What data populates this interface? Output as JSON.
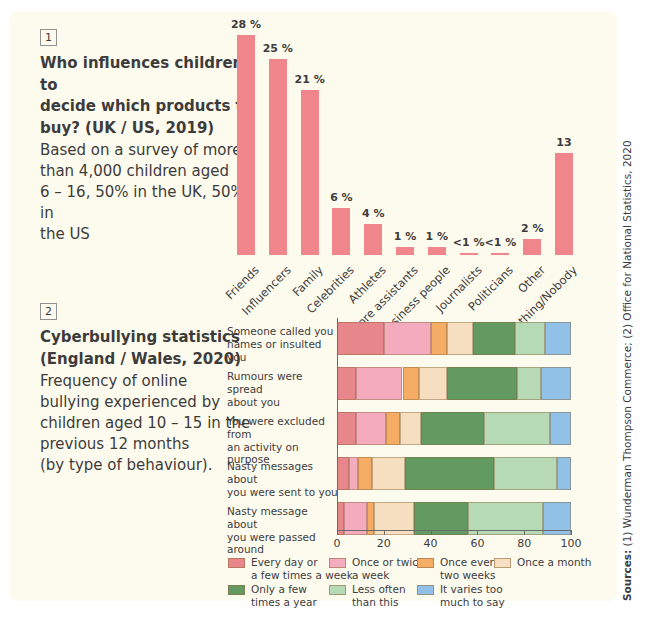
{
  "colors": {
    "page_bg": "#ffffff",
    "panel_bg": "#fdfbee",
    "text": "#3d3c3c",
    "axis": "#6a6a6a",
    "bar1": "#f0868c"
  },
  "source_note": {
    "label_bold": "Sources:",
    "text": "(1) Wunderman Thompson Commerce; (2) Office for National Statistics, 2020"
  },
  "chart_data": [
    {
      "type": "bar",
      "panel_index": "1",
      "title": "Who influences children to decide which products to buy? (UK / US, 2019)",
      "title_lines": [
        "Who influences children to",
        "decide which products to",
        "buy? (UK / US, 2019)"
      ],
      "subtitle": "Based on a survey of more than 4,000 children aged 6 – 16, 50% in the UK, 50% in the US",
      "subtitle_lines": [
        "Based on a survey of more",
        "than 4,000 children aged",
        "6 – 16, 50% in the UK, 50% in",
        "the US"
      ],
      "categories": [
        "Friends",
        "Influencers",
        "Family",
        "Celebrities",
        "Athletes",
        "Store assistants",
        "Business people",
        "Journalists",
        "Politicians",
        "Other",
        "Nothing/Nobody"
      ],
      "values": [
        28,
        25,
        21,
        6,
        4,
        1,
        1,
        0.5,
        0.5,
        2,
        13
      ],
      "value_labels": [
        "28 %",
        "25 %",
        "21 %",
        "6 %",
        "4 %",
        "1 %",
        "1 %",
        "<1 %",
        "<1 %",
        "2 %",
        "13"
      ],
      "bar_color": "#f0868c",
      "ylim": [
        0,
        30
      ],
      "grid": false,
      "legend_position": "none"
    },
    {
      "type": "bar",
      "subtype": "stacked_horizontal",
      "panel_index": "2",
      "title": "Cyberbullying statistics (England / Wales, 2020)",
      "title_lines": [
        "Cyberbullying statistics",
        "(England / Wales, 2020)"
      ],
      "subtitle": "Frequency of online bullying experienced by children aged 10 – 15 in the previous 12 months (by type of behaviour).",
      "subtitle_lines": [
        "Frequency of online",
        "bullying experienced by",
        "children aged 10 – 15 in the",
        "previous 12 months",
        "(by type of behaviour)."
      ],
      "categories": [
        "Someone called you names or insulted you",
        "Rumours were spread about you",
        "You were excluded from an activity on purpose",
        "Nasty messages about you were sent to you",
        "Nasty message about you were passed around"
      ],
      "category_lines": [
        [
          "Someone called you",
          "names or insulted you"
        ],
        [
          "Rumours were spread",
          "about you"
        ],
        [
          "You were excluded from",
          "an activity on purpose"
        ],
        [
          "Nasty messages about",
          "you were sent to you"
        ],
        [
          "Nasty message about",
          "you were passed around"
        ]
      ],
      "series": [
        {
          "name": "Every day or a few times a week",
          "legend_lines": [
            "Every day or",
            "a few times a week"
          ],
          "color": "#e8878b",
          "values": [
            20,
            8,
            8,
            5,
            3
          ]
        },
        {
          "name": "Once or twice a week",
          "legend_lines": [
            "Once or twice",
            "a week"
          ],
          "color": "#f3abbd",
          "values": [
            20,
            20,
            13,
            4,
            10
          ]
        },
        {
          "name": "Once every two weeks",
          "legend_lines": [
            "Once every",
            "two weeks"
          ],
          "color": "#f5ad66",
          "values": [
            7,
            7,
            6,
            6,
            3
          ]
        },
        {
          "name": "Once a month",
          "legend_lines": [
            "Once a month"
          ],
          "color": "#f6dfc0",
          "values": [
            11,
            12,
            9,
            14,
            17
          ]
        },
        {
          "name": "Only a few times a year",
          "legend_lines": [
            "Only a few",
            "times a year"
          ],
          "color": "#629a62",
          "values": [
            18,
            30,
            27,
            38,
            23
          ]
        },
        {
          "name": "Less often than this",
          "legend_lines": [
            "Less often",
            "than this"
          ],
          "color": "#b6d9b6",
          "values": [
            13,
            10,
            28,
            27,
            32
          ]
        },
        {
          "name": "It varies too much to say",
          "legend_lines": [
            "It varies too",
            "much to say"
          ],
          "color": "#92c1e8",
          "values": [
            11,
            13,
            9,
            6,
            12
          ]
        }
      ],
      "xlim": [
        0,
        100
      ],
      "x_ticks": [
        "0",
        "20",
        "40",
        "60",
        "80",
        "100"
      ],
      "grid": false,
      "legend_position": "bottom",
      "legend_rows": [
        [
          0,
          1,
          2,
          3
        ],
        [
          4,
          5,
          6
        ]
      ]
    }
  ]
}
